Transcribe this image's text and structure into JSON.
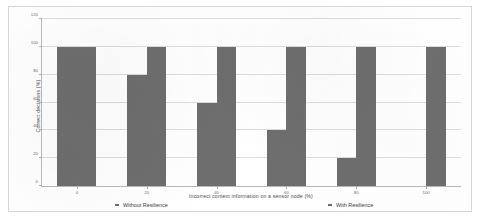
{
  "chart_data": {
    "type": "bar",
    "title": "",
    "xlabel": "Incorrect context information on a sensor node (%)",
    "ylabel": "Correct decisions (%)",
    "categories": [
      "0",
      "20",
      "40",
      "60",
      "80",
      "100"
    ],
    "ylim": [
      0,
      120
    ],
    "yticks": [
      0,
      20,
      40,
      60,
      80,
      100,
      120
    ],
    "ytick_labels": [
      "0",
      "20",
      "40",
      "60",
      "80",
      "100",
      "120"
    ],
    "grid": true,
    "legend_position": "bottom",
    "series": [
      {
        "name": "Without Resilience",
        "color": "#6e6e6e",
        "values": [
          100,
          80,
          60,
          40,
          20,
          0
        ]
      },
      {
        "name": "With Resilience",
        "color": "#6e6e6e",
        "values": [
          100,
          100,
          100,
          100,
          100,
          100
        ]
      }
    ]
  }
}
